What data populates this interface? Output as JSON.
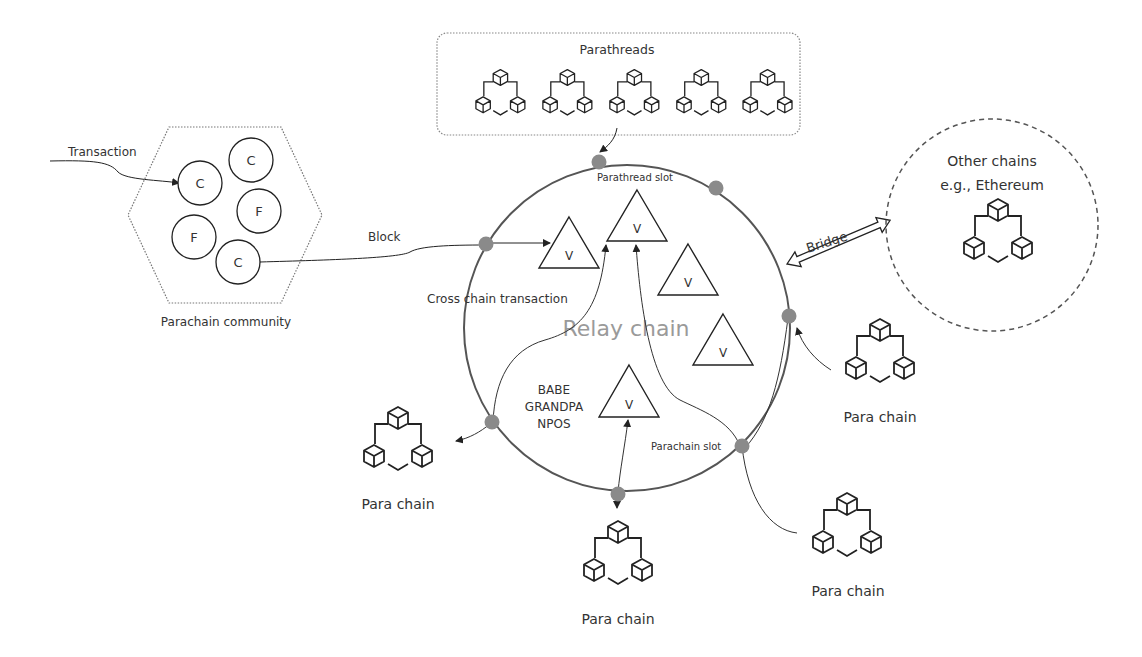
{
  "parathreads": {
    "title": "Parathreads",
    "count": 5
  },
  "community": {
    "label": "Parachain community",
    "transaction_label": "Transaction",
    "block_label": "Block",
    "nodes": [
      {
        "letter": "C",
        "x": 200,
        "y": 183
      },
      {
        "letter": "C",
        "x": 251,
        "y": 160
      },
      {
        "letter": "F",
        "x": 259,
        "y": 211
      },
      {
        "letter": "F",
        "x": 194,
        "y": 237
      },
      {
        "letter": "C",
        "x": 238,
        "y": 262
      }
    ]
  },
  "relay": {
    "label": "Relay chain",
    "parathread_slot": "Parathread slot",
    "parachain_slot": "Parachain slot",
    "cross_chain": "Cross chain transaction",
    "consensus": [
      "BABE",
      "GRANDPA",
      "NPOS"
    ],
    "validator_letter": "V"
  },
  "other_chains": {
    "line1": "Other chains",
    "line2": "e.g., Ethereum",
    "bridge_label": "Bridge"
  },
  "parachains": [
    {
      "label": "Para chain"
    },
    {
      "label": "Para chain"
    },
    {
      "label": "Para chain"
    },
    {
      "label": "Para chain"
    }
  ],
  "colors": {
    "line": "#2b2b2b",
    "slot": "#8a8a8a",
    "relay_text": "#9a9a9a",
    "dotted": "#888888"
  }
}
